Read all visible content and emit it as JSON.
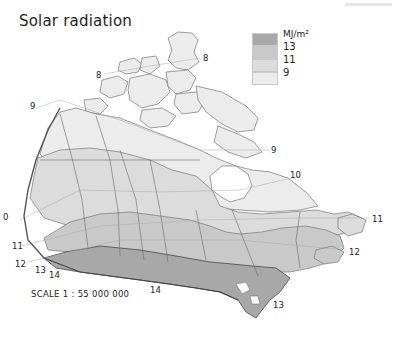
{
  "title": "Solar radiation",
  "legend": {
    "unit": "MJ/m²",
    "classes": [
      {
        "range": "> 13",
        "color": "#a8a8a8"
      },
      {
        "range": "11–13",
        "color": "#c9c9c9"
      },
      {
        "range": "9–11",
        "color": "#dcdcdc"
      },
      {
        "range": "< 9",
        "color": "#ececec"
      }
    ],
    "breaks": [
      "13",
      "11",
      "9"
    ]
  },
  "contour_labels": [
    {
      "value": "8",
      "x": 98,
      "y": 74
    },
    {
      "value": "8",
      "x": 204,
      "y": 55
    },
    {
      "value": "9",
      "x": 31,
      "y": 105
    },
    {
      "value": "9",
      "x": 272,
      "y": 147
    },
    {
      "value": "10",
      "x": 292,
      "y": 173
    },
    {
      "value": "0",
      "x": 3,
      "y": 212
    },
    {
      "value": "11",
      "x": 13,
      "y": 243
    },
    {
      "value": "12",
      "x": 16,
      "y": 261
    },
    {
      "value": "13",
      "x": 36,
      "y": 267
    },
    {
      "value": "14",
      "x": 49,
      "y": 271
    },
    {
      "value": "14",
      "x": 150,
      "y": 287
    },
    {
      "value": "13",
      "x": 273,
      "y": 303
    },
    {
      "value": "11",
      "x": 373,
      "y": 217
    },
    {
      "value": "12",
      "x": 350,
      "y": 249
    }
  ],
  "scale": "SCALE 1 : 55 000 000",
  "colors": {
    "zone_lt9": "#ececec",
    "zone_9_11": "#dcdcdc",
    "zone_11_13": "#c9c9c9",
    "zone_gt13": "#a8a8a8",
    "border": "#6a6a6a"
  }
}
